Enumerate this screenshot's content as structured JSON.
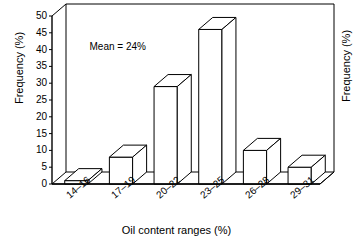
{
  "chart_data": {
    "type": "bar",
    "title": "",
    "subtitle": "",
    "xlabel": "Oil content ranges (%)",
    "ylabel": "Frequency (%)",
    "ylabel_right": "Frequency (%)",
    "categories": [
      "14–16",
      "17–19",
      "20–22",
      "23–25",
      "26–28",
      "29–31"
    ],
    "values": [
      1,
      8,
      29,
      46,
      10,
      5
    ],
    "series": [
      {
        "name": "Frequency (%)",
        "values": [
          1,
          8,
          29,
          46,
          10,
          5
        ]
      }
    ],
    "ylim": [
      0,
      50
    ],
    "yticks": [
      0,
      5,
      10,
      15,
      20,
      25,
      30,
      35,
      40,
      45,
      50
    ],
    "ytick_labels": [
      "0",
      "5",
      "10",
      "15",
      "20",
      "25",
      "30",
      "35",
      "40",
      "45",
      "50"
    ],
    "grid": false,
    "legend": "none",
    "style": "3d-isometric-outline",
    "annotations": [
      {
        "text": "Mean = 24%",
        "x_frac": 0.14,
        "y_value": 41
      }
    ]
  },
  "colors": {
    "line": "#000000",
    "bar_face": "#ffffff",
    "bar_top": "#ffffff",
    "bar_side": "#ffffff",
    "background": "#ffffff"
  }
}
